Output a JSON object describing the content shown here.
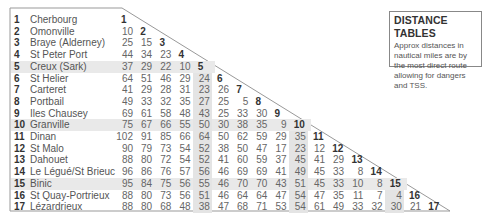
{
  "info_box": {
    "title": "DISTANCE TABLES",
    "description": "Approx distances in nautical miles are by the most direct route allowing for dangers and TSS."
  },
  "highlight_rows": [
    5,
    10,
    15
  ],
  "highlight_cols": [
    5,
    10,
    15
  ],
  "ports": [
    {
      "num": "1",
      "name": "Cherbourg",
      "distances": []
    },
    {
      "num": "2",
      "name": "Omonville",
      "distances": [
        "10"
      ]
    },
    {
      "num": "3",
      "name": "Braye (Alderney)",
      "distances": [
        "25",
        "15"
      ]
    },
    {
      "num": "4",
      "name": "St Peter Port",
      "distances": [
        "44",
        "34",
        "23"
      ]
    },
    {
      "num": "5",
      "name": "Creux (Sark)",
      "distances": [
        "37",
        "29",
        "22",
        "10"
      ]
    },
    {
      "num": "6",
      "name": "St Helier",
      "distances": [
        "64",
        "51",
        "46",
        "29",
        "24"
      ]
    },
    {
      "num": "7",
      "name": "Carteret",
      "distances": [
        "41",
        "29",
        "28",
        "31",
        "23",
        "26"
      ]
    },
    {
      "num": "8",
      "name": "Portbail",
      "distances": [
        "49",
        "33",
        "32",
        "35",
        "27",
        "25",
        "5"
      ]
    },
    {
      "num": "9",
      "name": "Iles Chausey",
      "distances": [
        "69",
        "61",
        "58",
        "48",
        "43",
        "25",
        "33",
        "30"
      ]
    },
    {
      "num": "10",
      "name": "Granville",
      "distances": [
        "75",
        "67",
        "66",
        "55",
        "50",
        "30",
        "38",
        "35",
        "9"
      ]
    },
    {
      "num": "11",
      "name": "Dinan",
      "distances": [
        "102",
        "91",
        "85",
        "66",
        "64",
        "50",
        "62",
        "59",
        "29",
        "35"
      ]
    },
    {
      "num": "12",
      "name": "St Malo",
      "distances": [
        "90",
        "79",
        "73",
        "54",
        "52",
        "38",
        "50",
        "47",
        "17",
        "23",
        "12"
      ]
    },
    {
      "num": "13",
      "name": "Dahouet",
      "distances": [
        "88",
        "80",
        "72",
        "54",
        "52",
        "41",
        "60",
        "59",
        "37",
        "45",
        "41",
        "29"
      ]
    },
    {
      "num": "14",
      "name": "Le Légué/St Brieuc",
      "distances": [
        "96",
        "86",
        "76",
        "57",
        "56",
        "46",
        "69",
        "69",
        "41",
        "49",
        "45",
        "33",
        "8"
      ]
    },
    {
      "num": "15",
      "name": "Binic",
      "distances": [
        "95",
        "84",
        "75",
        "56",
        "55",
        "46",
        "70",
        "70",
        "43",
        "51",
        "45",
        "33",
        "10",
        "8"
      ]
    },
    {
      "num": "16",
      "name": "St Quay-Portrieux",
      "distances": [
        "88",
        "80",
        "73",
        "56",
        "51",
        "46",
        "64",
        "64",
        "47",
        "54",
        "47",
        "35",
        "11",
        "7",
        "4"
      ]
    },
    {
      "num": "17",
      "name": "Lézardrieux",
      "distances": [
        "88",
        "80",
        "68",
        "48",
        "38",
        "47",
        "68",
        "71",
        "53",
        "54",
        "61",
        "49",
        "33",
        "32",
        "30",
        "21"
      ]
    }
  ]
}
